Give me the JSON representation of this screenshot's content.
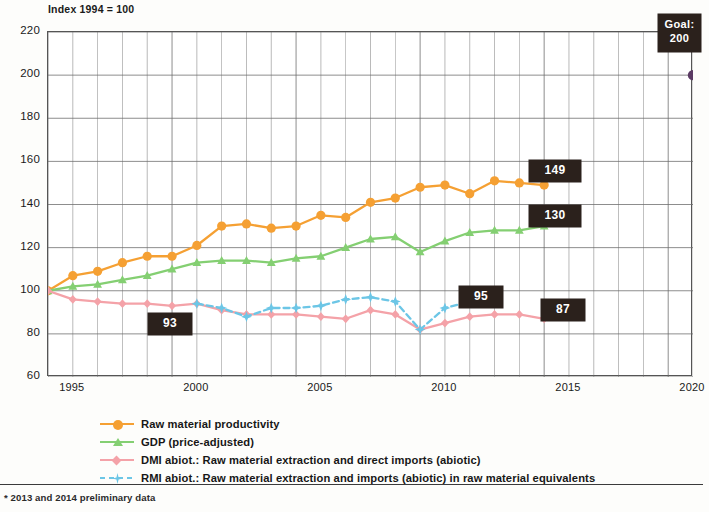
{
  "axis_title": "Index 1994 = 100",
  "footnote": "* 2013 and 2014 preliminary data",
  "colors": {
    "raw_material_productivity": "#F5A033",
    "gdp": "#84CF72",
    "dmi": "#F4A2A8",
    "rmi": "#6CC6E6",
    "goal_dot": "#5B3A64",
    "badge_bg": "#2B211C",
    "grid": "#6b6b6b",
    "frame": "#555555"
  },
  "yaxis": {
    "label": "",
    "min": 60,
    "max": 220,
    "step": 20,
    "ticks": [
      "220",
      "200",
      "180",
      "160",
      "140",
      "120",
      "100",
      "80",
      "60"
    ]
  },
  "xaxis": {
    "label": "",
    "min": 1994,
    "max": 2020,
    "ticks": [
      "1995",
      "2000",
      "2005",
      "2010",
      "2015",
      "2020"
    ]
  },
  "badges": [
    {
      "name": "badge-dmi-1999",
      "text": "93",
      "x": 148,
      "y": 313,
      "w": 44,
      "h": 22
    },
    {
      "name": "badge-productivity-2014",
      "text": "149",
      "x": 529,
      "y": 160,
      "w": 52,
      "h": 22
    },
    {
      "name": "badge-gdp-2014",
      "text": "130",
      "x": 529,
      "y": 205,
      "w": 52,
      "h": 22
    },
    {
      "name": "badge-rmi-2011",
      "text": "95",
      "x": 459,
      "y": 286,
      "w": 44,
      "h": 22
    },
    {
      "name": "badge-dmi-2014",
      "text": "87",
      "x": 541,
      "y": 299,
      "w": 44,
      "h": 22
    }
  ],
  "goal_badge": {
    "name": "badge-goal-2020",
    "line1": "Goal:",
    "line2": "200",
    "x": 658,
    "y": 14,
    "w": 43,
    "h": 38
  },
  "legend": {
    "items": [
      {
        "name": "legend-item-raw-material-productivity",
        "label": "Raw material productivity",
        "color": "#F5A033",
        "marker": "circle",
        "dashed": false
      },
      {
        "name": "legend-item-gdp",
        "label": "GDP (price-adjusted)",
        "color": "#84CF72",
        "marker": "triangle",
        "dashed": false
      },
      {
        "name": "legend-item-dmi",
        "label": "DMI abiot.: Raw material extraction and direct imports (abiotic)",
        "color": "#F4A2A8",
        "marker": "diamond",
        "dashed": false
      },
      {
        "name": "legend-item-rmi",
        "label": "RMI abiot.: Raw material extraction and imports (abiotic) in raw material equivalents",
        "color": "#6CC6E6",
        "marker": "star",
        "dashed": true
      }
    ]
  },
  "chart_data": {
    "type": "line",
    "title": "Index 1994 = 100",
    "subtitle": "",
    "xlabel": "",
    "ylabel": "Index 1994 = 100",
    "xlim": [
      1994,
      2020
    ],
    "ylim": [
      60,
      220
    ],
    "ytick_step": 20,
    "grid": true,
    "legend_position": "below",
    "x": [
      1994,
      1995,
      1996,
      1997,
      1998,
      1999,
      2000,
      2001,
      2002,
      2003,
      2004,
      2005,
      2006,
      2007,
      2008,
      2009,
      2010,
      2011,
      2012,
      2013,
      2014
    ],
    "series": [
      {
        "name": "Raw material productivity",
        "color": "#F5A033",
        "marker": "circle",
        "dashed": false,
        "x": [
          1994,
          1995,
          1996,
          1997,
          1998,
          1999,
          2000,
          2001,
          2002,
          2003,
          2004,
          2005,
          2006,
          2007,
          2008,
          2009,
          2010,
          2011,
          2012,
          2013,
          2014
        ],
        "values": [
          100,
          107,
          109,
          113,
          116,
          116,
          121,
          130,
          131,
          129,
          130,
          135,
          134,
          141,
          143,
          148,
          149,
          145,
          151,
          150,
          149
        ],
        "end_label": "149"
      },
      {
        "name": "GDP (price-adjusted)",
        "color": "#84CF72",
        "marker": "triangle",
        "dashed": false,
        "x": [
          1994,
          1995,
          1996,
          1997,
          1998,
          1999,
          2000,
          2001,
          2002,
          2003,
          2004,
          2005,
          2006,
          2007,
          2008,
          2009,
          2010,
          2011,
          2012,
          2013,
          2014
        ],
        "values": [
          100,
          102,
          103,
          105,
          107,
          110,
          113,
          114,
          114,
          113,
          115,
          116,
          120,
          124,
          125,
          118,
          123,
          127,
          128,
          128,
          130
        ],
        "end_label": "130"
      },
      {
        "name": "DMI abiot.: Raw material extraction and direct imports (abiotic)",
        "color": "#F4A2A8",
        "marker": "diamond",
        "dashed": false,
        "x": [
          1994,
          1995,
          1996,
          1997,
          1998,
          1999,
          2000,
          2001,
          2002,
          2003,
          2004,
          2005,
          2006,
          2007,
          2008,
          2009,
          2010,
          2011,
          2012,
          2013,
          2014
        ],
        "values": [
          100,
          96,
          95,
          94,
          94,
          93,
          94,
          91,
          89,
          89,
          89,
          88,
          87,
          91,
          89,
          82,
          85,
          88,
          89,
          89,
          87
        ],
        "end_label": "87"
      },
      {
        "name": "RMI abiot.: Raw material extraction and imports (abiotic) in raw material equivalents",
        "color": "#6CC6E6",
        "marker": "star",
        "dashed": true,
        "x": [
          2000,
          2001,
          2002,
          2003,
          2004,
          2005,
          2006,
          2007,
          2008,
          2009,
          2010,
          2011
        ],
        "values": [
          94,
          92,
          88,
          92,
          92,
          93,
          96,
          97,
          95,
          82,
          92,
          95
        ],
        "end_label": "95"
      }
    ],
    "annotations": [
      {
        "text": "93",
        "x": 1999,
        "y": 93,
        "kind": "badge"
      },
      {
        "text": "149",
        "x": 2014,
        "y": 149,
        "kind": "badge"
      },
      {
        "text": "130",
        "x": 2014,
        "y": 130,
        "kind": "badge"
      },
      {
        "text": "95",
        "x": 2011,
        "y": 95,
        "kind": "badge"
      },
      {
        "text": "87",
        "x": 2014,
        "y": 87,
        "kind": "badge"
      },
      {
        "text": "Goal: 200",
        "x": 2020,
        "y": 200,
        "kind": "goal-point",
        "color": "#5B3A64"
      }
    ],
    "goal_point": {
      "x": 2020,
      "y": 200,
      "label": "Goal: 200"
    }
  }
}
